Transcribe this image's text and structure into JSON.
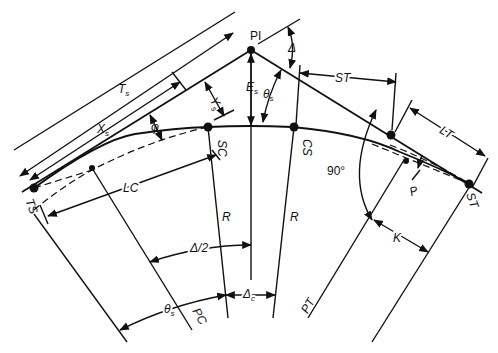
{
  "diagram": {
    "type": "spiral curve geometry (horizontal alignment)",
    "points": {
      "PI": "PI",
      "TS": "TS",
      "SC": "SC",
      "CS": "CS",
      "ST": "ST",
      "PC": "PC",
      "PT": "PT"
    },
    "dimensions": {
      "Ts": "T",
      "Ts_sub": "s",
      "Xs": "X",
      "Xs_sub": "s",
      "Ys": "Y",
      "Ys_sub": "s",
      "Es": "E",
      "Es_sub": "s",
      "theta_s_top": "θ",
      "theta_s_top_sub": "s",
      "theta_s_bottom": "θ",
      "theta_s_bottom_sub": "s",
      "delta": "Δ",
      "ST_dim": "ST",
      "LT": "LT",
      "LC": "LC",
      "phi": "φ",
      "R_left": "R",
      "R_right": "R",
      "delta_half": "Δ/2",
      "delta_c": "Δ",
      "delta_c_sub": "c",
      "right_angle": "90°",
      "P": "P",
      "K": "K"
    }
  }
}
